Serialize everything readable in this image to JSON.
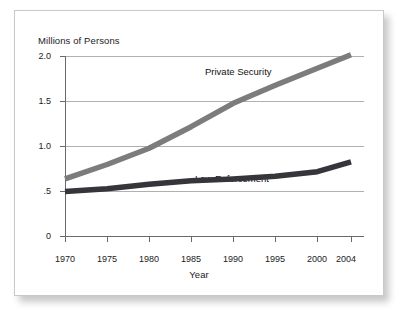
{
  "chart_data": {
    "type": "line",
    "title": "",
    "subtitle": "",
    "xlabel": "Year",
    "ylabel": "Millions of Persons",
    "x": [
      1970,
      1975,
      1980,
      1985,
      1990,
      1995,
      2000,
      2004
    ],
    "xlim": [
      1970,
      2004
    ],
    "ylim": [
      0,
      2.0
    ],
    "y_ticks": [
      0,
      0.5,
      1.0,
      1.5,
      2.0
    ],
    "y_tick_labels": [
      "0",
      ".5",
      "1.0",
      "1.5",
      "2.0"
    ],
    "x_tick_labels": [
      "1970",
      "1975",
      "1980",
      "1985",
      "1990",
      "1995",
      "2000",
      "2004"
    ],
    "grid": "horizontal",
    "legend_position": "inline-annotation",
    "series": [
      {
        "name": "Private Security",
        "color": "#7c7c7c",
        "values": [
          0.64,
          0.8,
          0.98,
          1.22,
          1.48,
          1.68,
          1.87,
          2.02
        ]
      },
      {
        "name": "Law Enforcement",
        "color": "#35353a",
        "values": [
          0.5,
          0.53,
          0.58,
          0.62,
          0.64,
          0.67,
          0.72,
          0.83
        ]
      }
    ],
    "annotations": [
      {
        "text": "Private Security",
        "x": 1989,
        "y": 1.86
      },
      {
        "text": "Law Enforcement",
        "x": 1989,
        "y": 0.97
      }
    ]
  },
  "axes": {
    "y_title": "Millions of Persons",
    "x_title": "Year",
    "y_ticks": [
      "2.0",
      "1.5",
      "1.0",
      ".5",
      "0"
    ],
    "x_ticks": [
      "1970",
      "1975",
      "1980",
      "1985",
      "1990",
      "1995",
      "2000",
      "2004"
    ]
  },
  "labels": {
    "private_security": "Private Security",
    "law_enforcement": "Law Enforcement"
  },
  "colors": {
    "private_security_line": "#7c7c7c",
    "law_enforcement_line": "#35353a",
    "grid": "#b0b0b0",
    "axis": "#5a5a5a",
    "frame": "#c9c9c9",
    "background": "#ffffff",
    "text": "#1b1b1b"
  }
}
